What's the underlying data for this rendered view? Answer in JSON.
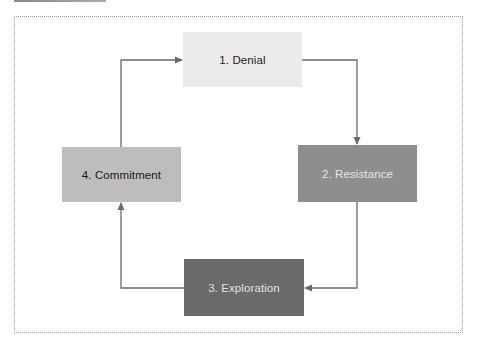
{
  "diagram": {
    "type": "cycle",
    "stages": [
      {
        "id": "denial",
        "label": "1. Denial",
        "fill": "#ebebeb",
        "text_color": "#1a1a1a"
      },
      {
        "id": "resistance",
        "label": "2. Resistance",
        "fill": "#8e8e8e",
        "text_color": "#e6e6e6"
      },
      {
        "id": "exploration",
        "label": "3. Exploration",
        "fill": "#6a6a6a",
        "text_color": "#e0e0e0"
      },
      {
        "id": "commitment",
        "label": "4. Commitment",
        "fill": "#bdbdbd",
        "text_color": "#1a1a1a"
      }
    ],
    "connections": [
      {
        "from": "denial",
        "to": "resistance",
        "bidirectional": true
      },
      {
        "from": "resistance",
        "to": "exploration",
        "bidirectional": true
      },
      {
        "from": "exploration",
        "to": "commitment",
        "bidirectional": true
      },
      {
        "from": "commitment",
        "to": "denial",
        "bidirectional": true
      }
    ],
    "connector_color": "#6b6b6b",
    "frame_border": "dotted"
  }
}
